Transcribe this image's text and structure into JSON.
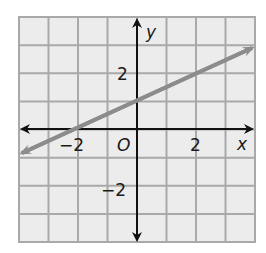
{
  "chart_data": {
    "type": "line",
    "title": "",
    "xlabel": "x",
    "ylabel": "y",
    "origin_label": "O",
    "xlim": [
      -4.5,
      3.5
    ],
    "ylim": [
      -4.5,
      3.5
    ],
    "grid": true,
    "x_tick_labels": [
      {
        "value": -2,
        "label": "−2"
      },
      {
        "value": 2,
        "label": "2"
      }
    ],
    "y_tick_labels": [
      {
        "value": 2,
        "label": "2"
      },
      {
        "value": -2,
        "label": "−2"
      }
    ],
    "series": [
      {
        "name": "line",
        "equation": "y = 0.5x + 1",
        "slope": 0.5,
        "intercept": 1,
        "color": "#8c8c8c",
        "points": [
          [
            -4.5,
            -1.25
          ],
          [
            -2,
            0
          ],
          [
            0,
            1
          ],
          [
            2,
            2
          ],
          [
            3.5,
            2.75
          ]
        ],
        "arrows_both_ends": true
      }
    ]
  },
  "colors": {
    "grid_bg": "#e8e8e8",
    "grid_line": "#a9a9a9",
    "axis": "#111111",
    "line": "#8c8c8c"
  }
}
